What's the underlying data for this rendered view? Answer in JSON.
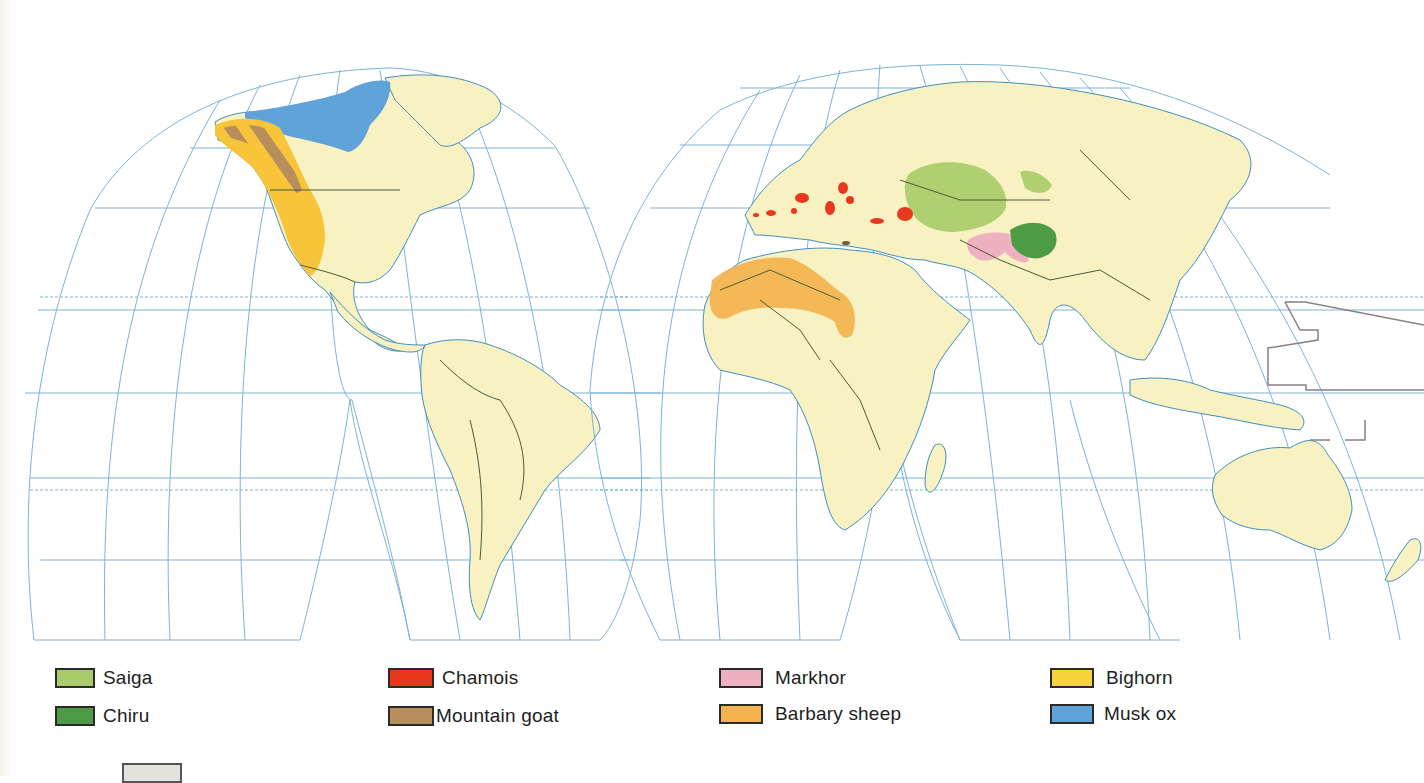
{
  "map": {
    "projection": "interrupted homolosine (two lobes shown: Americas, Eurasia/Africa/Oceania)",
    "colors": {
      "land": "#f8f1c2",
      "ocean": "#ffffff",
      "graticule": "#7eb3d8",
      "coastline": "#3f8fbf",
      "borders": "#4a5a3a",
      "date_line": "#8a7f86"
    },
    "ranges": [
      {
        "species": "Musk ox",
        "region": "Arctic Canada / Canadian Arctic archipelago"
      },
      {
        "species": "Bighorn",
        "region": "Western North America (Alaska to Mexico)"
      },
      {
        "species": "Mountain goat",
        "region": "Rockies / Coast ranges, Alaska to Washington (striped over Bighorn)"
      },
      {
        "species": "Chamois",
        "region": "European mountains: Pyrenees, Alps, Carpathians, Balkans, Turkey, Caucasus"
      },
      {
        "species": "Barbary sheep",
        "region": "Sahara, North Africa"
      },
      {
        "species": "Saiga",
        "region": "Central Asian steppes (Kazakhstan to Mongolia)"
      },
      {
        "species": "Markhor",
        "region": "Afghanistan, Pakistan, Kashmir"
      },
      {
        "species": "Chiru",
        "region": "Tibetan Plateau"
      }
    ]
  },
  "legend": {
    "items": [
      {
        "label": "Saiga",
        "color": "#a9cc6a"
      },
      {
        "label": "Chiru",
        "color": "#4d9a47"
      },
      {
        "label": "Chamois",
        "color": "#e8381e"
      },
      {
        "label": "Mountain goat",
        "color": "#b88e5c"
      },
      {
        "label": "Markhor",
        "color": "#efb1bf"
      },
      {
        "label": "Barbary sheep",
        "color": "#f3b24a"
      },
      {
        "label": "Bighorn",
        "color": "#f7d43a"
      },
      {
        "label": "Musk ox",
        "color": "#5fa3d9"
      }
    ],
    "extra_swatch_color": "#e4e2dc"
  }
}
